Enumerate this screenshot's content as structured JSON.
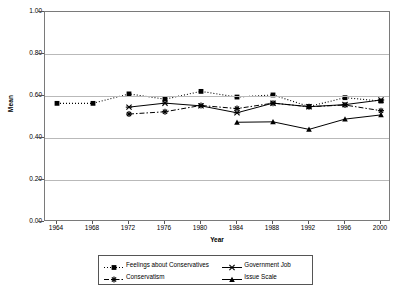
{
  "chart_data": {
    "type": "line",
    "title": "",
    "xlabel": "Year",
    "ylabel": "Mean",
    "categories": [
      "1964",
      "1968",
      "1972",
      "1976",
      "1980",
      "1984",
      "1988",
      "1992",
      "1996",
      "2000"
    ],
    "x": [
      1964,
      1968,
      1972,
      1976,
      1980,
      1984,
      1988,
      1992,
      1996,
      2000
    ],
    "ylim": [
      0.0,
      1.0
    ],
    "ytick_labels": [
      "0.00",
      "0.20",
      "0.40",
      "0.60",
      "0.80",
      "1.00"
    ],
    "ytick_values": [
      0.0,
      0.2,
      0.4,
      0.6,
      0.8,
      1.0
    ],
    "grid": "horizontal",
    "legend_position": "bottom",
    "series": [
      {
        "name": "Feelings about Conservatives",
        "marker": "square",
        "line_style": "dotted",
        "color": "#000000",
        "values": [
          0.565,
          0.565,
          0.61,
          0.585,
          0.622,
          0.595,
          0.605,
          0.55,
          0.592,
          0.576
        ]
      },
      {
        "name": "Government Job",
        "marker": "x",
        "line_style": "solid",
        "color": "#000000",
        "values": [
          null,
          null,
          0.547,
          0.566,
          0.553,
          0.52,
          0.566,
          0.549,
          0.559,
          0.581
        ]
      },
      {
        "name": "Conservatism",
        "marker": "plus",
        "line_style": "dash-dot",
        "color": "#000000",
        "values": [
          null,
          null,
          0.514,
          0.525,
          0.555,
          0.54,
          0.566,
          0.549,
          0.557,
          0.53
        ]
      },
      {
        "name": "Issue Scale",
        "marker": "triangle",
        "line_style": "solid",
        "color": "#000000",
        "values": [
          null,
          null,
          null,
          null,
          null,
          0.475,
          0.477,
          0.441,
          0.49,
          0.51
        ]
      }
    ]
  },
  "legend": {
    "items": [
      {
        "label": "Feelings about Conservatives"
      },
      {
        "label": "Government Job"
      },
      {
        "label": "Conservatism"
      },
      {
        "label": "Issue Scale"
      }
    ]
  }
}
